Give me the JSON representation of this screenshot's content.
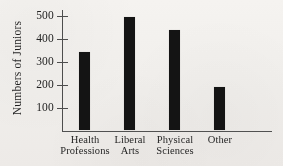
{
  "chart_data": {
    "type": "bar",
    "title": "",
    "subtitle": "",
    "xlabel": "",
    "ylabel": "Numbers of Juniors",
    "categories": [
      "Health Professions",
      "Liberal Arts",
      "Physical Sciences",
      "Other"
    ],
    "category_lines": [
      [
        "Health",
        "Professions"
      ],
      [
        "Liberal",
        "Arts"
      ],
      [
        "Physical",
        "Sciences"
      ],
      [
        "Other"
      ]
    ],
    "values": [
      340,
      495,
      435,
      190
    ],
    "ylim": [
      0,
      530
    ],
    "yticks": [
      100,
      200,
      300,
      400,
      500
    ],
    "ytick_labels": [
      "100",
      "200",
      "300",
      "400",
      "500"
    ],
    "grid": false,
    "legend": null,
    "bar_color": "#101010",
    "axis_color": "#4b4b4b",
    "background_color": "#f4f2ef",
    "annotations": []
  },
  "axis": {
    "y_title": "Numbers of Juniors"
  },
  "ticks": {
    "t500": "500",
    "t400": "400",
    "t300": "300",
    "t200": "200",
    "t100": "100"
  },
  "bars": [
    {
      "label": "Health Professions",
      "line1": "Health",
      "line2": "Professions",
      "value": 340
    },
    {
      "label": "Liberal Arts",
      "line1": "Liberal",
      "line2": "Arts",
      "value": 495
    },
    {
      "label": "Physical Sciences",
      "line1": "Physical",
      "line2": "Sciences",
      "value": 435
    },
    {
      "label": "Other",
      "line1": "Other",
      "line2": "",
      "value": 190
    }
  ]
}
